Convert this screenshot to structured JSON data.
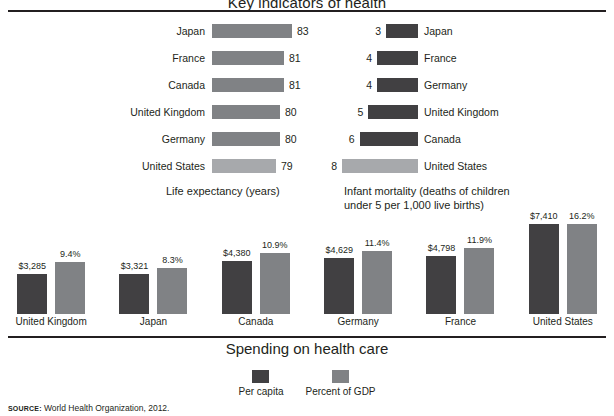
{
  "title": "Key indicators of health",
  "source": {
    "label": "SOURCE:",
    "text": "World Health Organization, 2012."
  },
  "colors": {
    "dark": "#414042",
    "mid": "#808285",
    "light": "#a7a9ac",
    "text": "#231f20"
  },
  "life_expectancy": {
    "caption": "Life expectancy (years)",
    "rows": [
      {
        "country": "Japan",
        "value": 83,
        "highlight": false
      },
      {
        "country": "France",
        "value": 81,
        "highlight": false
      },
      {
        "country": "Canada",
        "value": 81,
        "highlight": false
      },
      {
        "country": "United Kingdom",
        "value": 80,
        "highlight": false
      },
      {
        "country": "Germany",
        "value": 80,
        "highlight": false
      },
      {
        "country": "United States",
        "value": 79,
        "highlight": true
      }
    ]
  },
  "infant_mortality": {
    "caption": "Infant mortality (deaths of children under 5 per 1,000 live births)",
    "rows": [
      {
        "country": "Japan",
        "value": 3,
        "highlight": false
      },
      {
        "country": "France",
        "value": 4,
        "highlight": false
      },
      {
        "country": "Germany",
        "value": 4,
        "highlight": false
      },
      {
        "country": "United Kingdom",
        "value": 5,
        "highlight": false
      },
      {
        "country": "Canada",
        "value": 6,
        "highlight": false
      },
      {
        "country": "United States",
        "value": 8,
        "highlight": true
      }
    ]
  },
  "spending": {
    "title": "Spending on health care",
    "legend": [
      {
        "key": "capita",
        "label": "Per capita"
      },
      {
        "key": "gdp",
        "label": "Percent of GDP"
      }
    ],
    "groups": [
      {
        "country": "United Kingdom",
        "capita_label": "$3,285",
        "capita": 3285,
        "gdp_label": "9.4%",
        "gdp": 9.4
      },
      {
        "country": "Japan",
        "capita_label": "$3,321",
        "capita": 3321,
        "gdp_label": "8.3%",
        "gdp": 8.3
      },
      {
        "country": "Canada",
        "capita_label": "$4,380",
        "capita": 4380,
        "gdp_label": "10.9%",
        "gdp": 10.9
      },
      {
        "country": "Germany",
        "capita_label": "$4,629",
        "capita": 4629,
        "gdp_label": "11.4%",
        "gdp": 11.4
      },
      {
        "country": "France",
        "capita_label": "$4,798",
        "capita": 4798,
        "gdp_label": "11.9%",
        "gdp": 11.9
      },
      {
        "country": "United States",
        "capita_label": "$7,410",
        "capita": 7410,
        "gdp_label": "16.2%",
        "gdp": 16.2
      }
    ]
  },
  "chart_data": [
    {
      "type": "bar",
      "title": "Life expectancy (years)",
      "orientation": "horizontal",
      "categories": [
        "Japan",
        "France",
        "Canada",
        "United Kingdom",
        "Germany",
        "United States"
      ],
      "values": [
        83,
        81,
        81,
        80,
        80,
        79
      ],
      "xlabel": "Life expectancy (years)",
      "ylabel": "",
      "xlim": [
        0,
        85
      ],
      "grid": false,
      "legend": "none",
      "highlighted": [
        "United States"
      ]
    },
    {
      "type": "bar",
      "title": "Infant mortality (deaths of children under 5 per 1,000 live births)",
      "orientation": "horizontal",
      "categories": [
        "Japan",
        "France",
        "Germany",
        "United Kingdom",
        "Canada",
        "United States"
      ],
      "values": [
        3,
        4,
        4,
        5,
        6,
        8
      ],
      "xlabel": "Infant mortality (deaths of children under 5 per 1,000 live births)",
      "ylabel": "",
      "xlim": [
        0,
        8
      ],
      "grid": false,
      "legend": "none",
      "highlighted": [
        "United States"
      ]
    },
    {
      "type": "bar",
      "title": "Spending on health care",
      "orientation": "vertical",
      "categories": [
        "United Kingdom",
        "Japan",
        "Canada",
        "Germany",
        "France",
        "United States"
      ],
      "series": [
        {
          "name": "Per capita",
          "values": [
            3285,
            3321,
            4380,
            4629,
            4798,
            7410
          ]
        },
        {
          "name": "Percent of GDP",
          "values": [
            9.4,
            8.3,
            10.9,
            11.4,
            11.9,
            16.2
          ]
        }
      ],
      "xlabel": "",
      "ylabel": "",
      "grid": false,
      "legend": "bottom-center"
    }
  ]
}
